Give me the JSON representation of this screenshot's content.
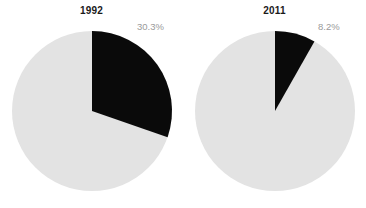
{
  "chart_data": {
    "type": "pie",
    "title": "",
    "charts": [
      {
        "title": "1992",
        "categories": [
          "Highlighted share",
          "Remainder"
        ],
        "values": [
          30.3,
          69.7
        ],
        "colors": [
          "#0a0a0a",
          "#e3e3e3"
        ],
        "label": "30.3%",
        "start_angle_deg": 0,
        "direction": "clockwise"
      },
      {
        "title": "2011",
        "categories": [
          "Highlighted share",
          "Remainder"
        ],
        "values": [
          8.2,
          91.8
        ],
        "colors": [
          "#0a0a0a",
          "#e3e3e3"
        ],
        "label": "8.2%",
        "start_angle_deg": 0,
        "direction": "clockwise"
      }
    ],
    "xlabel": "",
    "ylabel": "",
    "legend": "none",
    "grid": false
  },
  "figure": {
    "background_color": "#ffffff",
    "slice_dark_color": "#0a0a0a",
    "slice_light_color": "#e3e3e3",
    "label_color": "#9a9a9a",
    "title_color": "#1a1a1a"
  },
  "panels": [
    {
      "title": "1992",
      "percent_label": "30.3%",
      "dark_share": 30.3,
      "light_share": 69.7
    },
    {
      "title": "2011",
      "percent_label": "8.2%",
      "dark_share": 8.2,
      "light_share": 91.8
    }
  ]
}
